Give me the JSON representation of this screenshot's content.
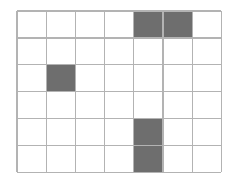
{
  "figure": {
    "name": "shaded-grid-diagram",
    "type": "grid",
    "background_color": "#ffffff"
  },
  "grid": {
    "columns": 7,
    "rows": 6,
    "origin_x": 17,
    "origin_y": 11,
    "cell_width": 29.2,
    "cell_height": 26.9,
    "line_color": "#b3b3b3",
    "line_width": 1.3,
    "cell_fill_color": "#ffffff",
    "shaded_fill_color": "#6e6e6e"
  },
  "shaded_cells": [
    {
      "label": "r1c5",
      "row": 1,
      "col": 5
    },
    {
      "label": "r1c6",
      "row": 1,
      "col": 6
    },
    {
      "label": "r3c2",
      "row": 3,
      "col": 2
    },
    {
      "label": "r5c5",
      "row": 5,
      "col": 5
    },
    {
      "label": "r6c5",
      "row": 6,
      "col": 5
    }
  ],
  "counts": {
    "total_cells": 42,
    "shaded_count": 5,
    "unshaded_count": 37
  }
}
